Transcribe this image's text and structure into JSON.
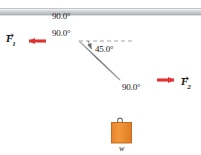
{
  "figure": {
    "background_color": "#ffffff",
    "rope_color": "#808080",
    "ceiling_color": "#c9ccce",
    "force_arrow_color": "#e03232",
    "block_fill_color": "#f0912f",
    "block_stroke_color": "#c0641a",
    "dashed_color": "#9a9a9a"
  },
  "ceiling": {
    "name": "support-beam",
    "description": "horizontal gray ceiling beam"
  },
  "angles": [
    {
      "id": "angle-top",
      "value": "90.0°",
      "x": 52,
      "y": 12
    },
    {
      "id": "angle-knot",
      "value": "90.0°",
      "x": 52,
      "y": 29
    },
    {
      "id": "angle-diagonal",
      "value": "45.0°",
      "x": 95,
      "y": 49
    },
    {
      "id": "angle-lower",
      "value": "90.0°",
      "x": 122,
      "y": 85
    }
  ],
  "forces": [
    {
      "id": "force-f1",
      "label": "F",
      "subscript": "1",
      "direction": "left",
      "label_x": 6,
      "label_y": 35
    },
    {
      "id": "force-f2",
      "label": "F",
      "subscript": "2",
      "direction": "right",
      "label_x": 181,
      "label_y": 78
    }
  ],
  "block": {
    "id": "hanging-block",
    "weight_label": "w",
    "weight_label_x": 119,
    "weight_label_y": 145
  }
}
